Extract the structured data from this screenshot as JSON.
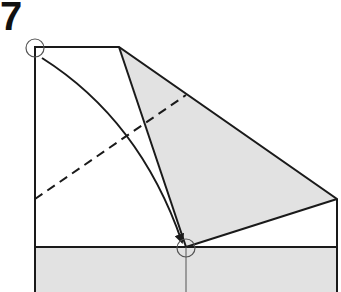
{
  "diagram": {
    "type": "origami-step",
    "step_number": "7",
    "colors": {
      "paper_back": "#e2e2e2",
      "paper_front": "#ffffff",
      "line": "#1a1a1a"
    },
    "elements": [
      "valley-fold-dashed-line",
      "curved-arrow-top-left-to-bottom-point",
      "reference-circle-top-left-corner",
      "reference-circle-target-point"
    ]
  }
}
